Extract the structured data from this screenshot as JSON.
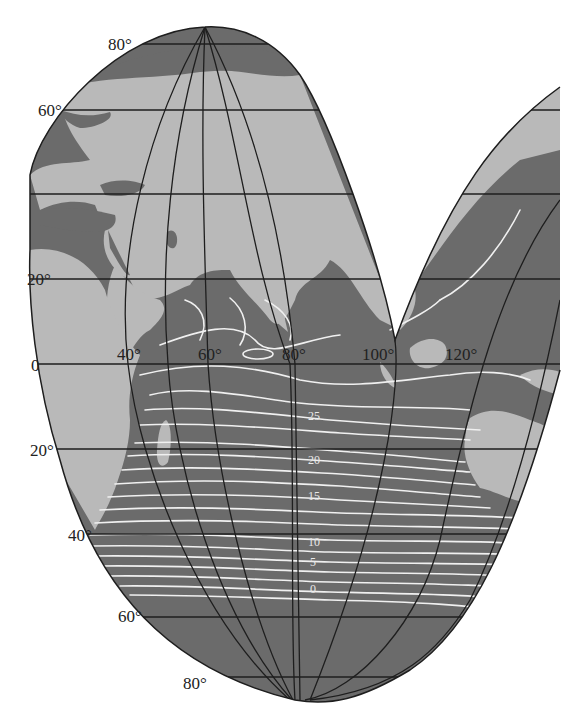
{
  "map": {
    "subject": "Indian Ocean sea surface temperature isotherms",
    "projection": "interrupted (lobed) pseudo-conic",
    "colors": {
      "background": "#ffffff",
      "land": "#b9b9b9",
      "ocean": "#6b6b6b",
      "graticule": "#1e1e1e",
      "isotherm": "#f0f0f0"
    },
    "latitude_labels": [
      {
        "text": "80°",
        "x": 108,
        "y": 46
      },
      {
        "text": "60°",
        "x": 38,
        "y": 114
      },
      {
        "text": "20°",
        "x": 27,
        "y": 285
      },
      {
        "text": "0",
        "x": 31,
        "y": 370
      },
      {
        "text": "20°",
        "x": 30,
        "y": 456
      },
      {
        "text": "40°",
        "x": 68,
        "y": 541
      },
      {
        "text": "60°",
        "x": 118,
        "y": 622
      },
      {
        "text": "80°",
        "x": 183,
        "y": 689
      }
    ],
    "longitude_labels": [
      {
        "text": "40°",
        "x": 117,
        "y": 360
      },
      {
        "text": "60°",
        "x": 198,
        "y": 360
      },
      {
        "text": "80°",
        "x": 282,
        "y": 360
      },
      {
        "text": "100°",
        "x": 362,
        "y": 360
      },
      {
        "text": "120°",
        "x": 445,
        "y": 360
      }
    ],
    "isotherm_labels": [
      {
        "text": "25",
        "x": 308,
        "y": 420
      },
      {
        "text": "20",
        "x": 308,
        "y": 464
      },
      {
        "text": "15",
        "x": 308,
        "y": 500
      },
      {
        "text": "10",
        "x": 308,
        "y": 546
      },
      {
        "text": "5",
        "x": 310,
        "y": 566
      },
      {
        "text": "0",
        "x": 310,
        "y": 593
      }
    ]
  }
}
